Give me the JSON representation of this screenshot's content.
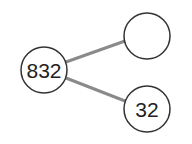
{
  "diagram": {
    "type": "number-bond",
    "colors": {
      "line": "#8a8a8a",
      "circle_stroke": "#333333",
      "circle_fill": "#ffffff",
      "text": "#222222"
    },
    "nodes": [
      {
        "id": "whole",
        "label": "832"
      },
      {
        "id": "part-top",
        "label": ""
      },
      {
        "id": "part-bottom",
        "label": "32"
      }
    ],
    "edges": [
      {
        "from": "whole",
        "to": "part-top"
      },
      {
        "from": "whole",
        "to": "part-bottom"
      }
    ]
  }
}
